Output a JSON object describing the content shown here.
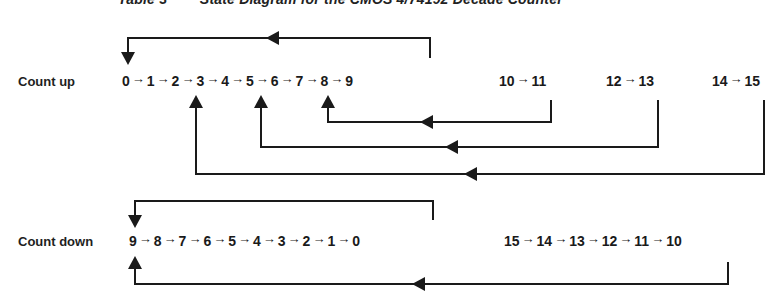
{
  "title": "Table 3        State Diagram for the CMOS 4/74192 Decade Counter",
  "arrow_glyph": "→",
  "count_up": {
    "label": "Count up",
    "main_sequence": [
      "0",
      "1",
      "2",
      "3",
      "4",
      "5",
      "6",
      "7",
      "8",
      "9"
    ],
    "extra_pairs": [
      {
        "from": "10",
        "to": "11"
      },
      {
        "from": "12",
        "to": "13"
      },
      {
        "from": "14",
        "to": "15"
      }
    ],
    "feedback": [
      {
        "from": "9",
        "to": "0"
      },
      {
        "from": "11",
        "to": "6"
      },
      {
        "from": "13",
        "to": "4"
      },
      {
        "from": "15",
        "to": "2"
      }
    ]
  },
  "count_down": {
    "label": "Count down",
    "main_sequence": [
      "9",
      "8",
      "7",
      "6",
      "5",
      "4",
      "3",
      "2",
      "1",
      "0"
    ],
    "extra_sequence": [
      "15",
      "14",
      "13",
      "12",
      "11",
      "10"
    ],
    "feedback": [
      {
        "from": "0",
        "to": "9"
      },
      {
        "from": "10",
        "to": "9"
      }
    ]
  },
  "colors": {
    "line": "#1a1a1a",
    "text": "#1a1a1a",
    "background": "#ffffff"
  }
}
